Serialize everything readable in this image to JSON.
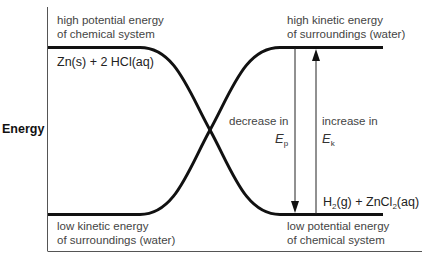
{
  "diagram": {
    "y_axis_label": "Energy",
    "top_left": {
      "line1": "high potential energy",
      "line2": "of chemical system"
    },
    "reactants": {
      "pre": "Zn(s) + 2 HCl(aq)"
    },
    "top_right": {
      "line1": "high kinetic energy",
      "line2": "of surroundings (water)"
    },
    "bottom_left": {
      "line1": "low kinetic energy",
      "line2": "of surroundings (water)"
    },
    "bottom_right": {
      "line1": "low potential energy",
      "line2": "of chemical system"
    },
    "products": {
      "h": "H",
      "h_sub": "2",
      "mid": "(g) + ZnCl",
      "zn_sub": "2",
      "end": "(aq)"
    },
    "decrease": {
      "text": "decrease in",
      "symbol": "E",
      "sub": "p"
    },
    "increase": {
      "text": "increase in",
      "symbol": "E",
      "sub": "k"
    },
    "colors": {
      "curve": "#111111",
      "axis": "#555555",
      "text": "#444444"
    }
  }
}
